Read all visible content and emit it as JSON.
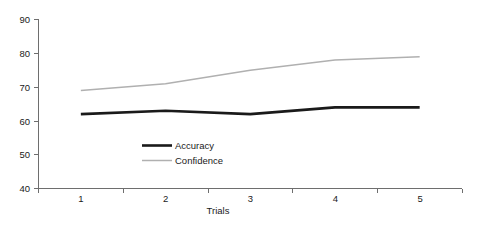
{
  "chart_data": {
    "type": "line",
    "title": "",
    "xlabel": "Trials",
    "ylabel": "",
    "categories": [
      "1",
      "2",
      "3",
      "4",
      "5"
    ],
    "x": [
      1,
      2,
      3,
      4,
      5
    ],
    "series": [
      {
        "name": "Accuracy",
        "values": [
          62,
          63,
          62,
          64,
          64
        ],
        "color": "#1a1a1a",
        "line_width": 2.6
      },
      {
        "name": "Confidence",
        "values": [
          69,
          71,
          75,
          78,
          79
        ],
        "color": "#b0b0b0",
        "line_width": 1.5
      }
    ],
    "ylim": [
      40,
      90
    ],
    "yticks": [
      40,
      50,
      60,
      70,
      80,
      90
    ],
    "ytick_labels": [
      "40",
      "50",
      "60",
      "70",
      "80",
      "90"
    ],
    "xtick_labels": [
      "1",
      "2",
      "3",
      "4",
      "5"
    ],
    "grid": false,
    "legend_position": "inside-center-lower",
    "legend_entries": [
      "Accuracy",
      "Confidence"
    ],
    "axis_color": "#6e6e6e",
    "background": "#ffffff"
  },
  "axis": {
    "y_label_90": "90",
    "y_label_80": "80",
    "y_label_70": "70",
    "y_label_60": "60",
    "y_label_50": "50",
    "y_label_40": "40",
    "x_label_1": "1",
    "x_label_2": "2",
    "x_label_3": "3",
    "x_label_4": "4",
    "x_label_5": "5",
    "x_title": "Trials"
  },
  "legend": {
    "accuracy_label": "Accuracy",
    "confidence_label": "Confidence"
  }
}
